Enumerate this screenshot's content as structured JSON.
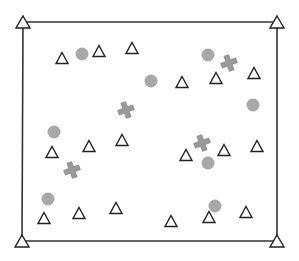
{
  "diagram": {
    "type": "scatter-map",
    "colors": {
      "background": "#ffffff",
      "frame": "#333333",
      "triangle_stroke": "#222222",
      "triangle_fill": "#ffffff",
      "circle_fill": "#a8a8a8",
      "cross_fill": "#9a9a9a",
      "cross_stroke": "#7a7a7a"
    },
    "frame": {
      "corners": [
        {
          "x": 23,
          "y": 22
        },
        {
          "x": 277,
          "y": 22
        },
        {
          "x": 277,
          "y": 241
        },
        {
          "x": 22,
          "y": 241
        }
      ]
    },
    "corner_triangles": [
      {
        "x": 23,
        "y": 22
      },
      {
        "x": 277,
        "y": 22
      },
      {
        "x": 22,
        "y": 241
      },
      {
        "x": 277,
        "y": 241
      }
    ],
    "triangles": [
      {
        "x": 62,
        "y": 58
      },
      {
        "x": 99,
        "y": 51
      },
      {
        "x": 132,
        "y": 48
      },
      {
        "x": 182,
        "y": 82
      },
      {
        "x": 216,
        "y": 78
      },
      {
        "x": 254,
        "y": 73
      },
      {
        "x": 52,
        "y": 152
      },
      {
        "x": 89,
        "y": 146
      },
      {
        "x": 122,
        "y": 140
      },
      {
        "x": 186,
        "y": 155
      },
      {
        "x": 224,
        "y": 150
      },
      {
        "x": 257,
        "y": 146
      },
      {
        "x": 44,
        "y": 218
      },
      {
        "x": 79,
        "y": 213
      },
      {
        "x": 116,
        "y": 208
      },
      {
        "x": 171,
        "y": 221
      },
      {
        "x": 209,
        "y": 217
      },
      {
        "x": 246,
        "y": 212
      }
    ],
    "circles": [
      {
        "x": 82,
        "y": 54
      },
      {
        "x": 208,
        "y": 55
      },
      {
        "x": 151,
        "y": 81
      },
      {
        "x": 253,
        "y": 105
      },
      {
        "x": 54,
        "y": 132
      },
      {
        "x": 208,
        "y": 163
      },
      {
        "x": 48,
        "y": 199
      },
      {
        "x": 215,
        "y": 206
      }
    ],
    "crosses": [
      {
        "x": 229,
        "y": 63
      },
      {
        "x": 126,
        "y": 110
      },
      {
        "x": 72,
        "y": 170
      },
      {
        "x": 202,
        "y": 143
      }
    ],
    "sizes": {
      "triangle_half_width": 6,
      "triangle_height": 11,
      "corner_triangle_half_width": 7,
      "corner_triangle_height": 12,
      "circle_radius": 6.5,
      "cross_arm": 8,
      "cross_width": 5
    }
  }
}
